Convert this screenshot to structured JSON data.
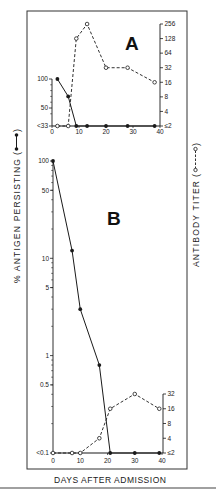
{
  "figure": {
    "y_left_title": "% ANTIGEN PERSISTING",
    "y_right_title": "ANTIBODY TITER",
    "x_title": "DAYS AFTER ADMISSION",
    "paren_open": "(",
    "paren_close": ")",
    "colors": {
      "ink": "#1a1a1a",
      "frame": "#333333",
      "separator": "#a0a0a0",
      "background": "#ffffff"
    }
  },
  "chart_data": [
    {
      "panel": "A",
      "type": "line",
      "title": "A",
      "xlabel": "DAYS AFTER ADMISSION",
      "ylabel_left": "% ANTIGEN PERSISTING",
      "ylabel_right": "ANTIBODY TITER",
      "xlim": [
        0,
        40
      ],
      "x_ticks": [
        "0",
        "10",
        "20",
        "30",
        "40"
      ],
      "y_left_scale": "linear",
      "y_left_ticks": [
        "100",
        "50",
        "<33"
      ],
      "y_right_scale": "log2",
      "y_right_ticks": [
        "256",
        "128",
        "64",
        "32",
        "16",
        "8",
        "4",
        "≤2"
      ],
      "grid": false,
      "series": [
        {
          "name": "% Antigen persisting",
          "axis": "left",
          "marker": "filled-circle",
          "line": "solid",
          "x": [
            2,
            6,
            9,
            13,
            20,
            28,
            38
          ],
          "values": [
            100,
            70,
            "<33",
            "<33",
            "<33",
            "<33",
            "<33"
          ]
        },
        {
          "name": "Antibody titer",
          "axis": "right",
          "marker": "open-circle",
          "line": "dashed",
          "x": [
            2,
            6,
            9,
            13,
            20,
            28,
            38
          ],
          "values": [
            "≤2",
            "≤2",
            128,
            256,
            32,
            32,
            16
          ]
        }
      ]
    },
    {
      "panel": "B",
      "type": "line",
      "title": "B",
      "xlabel": "DAYS AFTER ADMISSION",
      "ylabel_left": "% ANTIGEN PERSISTING",
      "ylabel_right": "ANTIBODY TITER",
      "xlim": [
        0,
        40
      ],
      "x_ticks": [
        "0",
        "10",
        "20",
        "30",
        "40"
      ],
      "y_left_scale": "log10",
      "y_left_ticks": [
        "100",
        "50",
        "10",
        "5",
        "1",
        "0.5",
        "<0.1"
      ],
      "y_right_scale": "log2",
      "y_right_ticks": [
        "32",
        "16",
        "8",
        "4",
        "≤2"
      ],
      "grid": false,
      "series": [
        {
          "name": "% Antigen persisting",
          "axis": "left",
          "marker": "filled-circle",
          "line": "solid",
          "x": [
            0,
            7,
            10,
            17,
            21,
            30,
            39
          ],
          "values": [
            100,
            12,
            3,
            0.8,
            "<0.1",
            "<0.1",
            "<0.1"
          ]
        },
        {
          "name": "Antibody titer",
          "axis": "right",
          "marker": "open-circle",
          "line": "dashed",
          "x": [
            0,
            7,
            10,
            17,
            21,
            30,
            39
          ],
          "values": [
            "≤2",
            "≤2",
            "≤2",
            4,
            16,
            32,
            16
          ]
        }
      ]
    }
  ]
}
